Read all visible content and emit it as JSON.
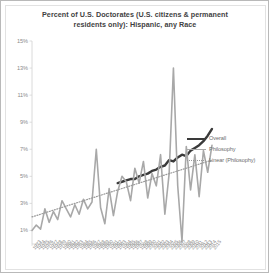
{
  "chart_data": {
    "type": "line",
    "title": "Percent of U.S. Doctorates (U.S. citizens & permanent residents only): Hispanic, any Race",
    "title_line1": "Percent of U.S. Doctorates (U.S. citizens & permanent",
    "title_line2": "residents only): Hispanic, any Race",
    "xlabel": "",
    "ylabel": "",
    "ylim": [
      0,
      15
    ],
    "yticks": [
      1,
      3,
      5,
      7,
      9,
      11,
      13,
      15
    ],
    "ytick_labels": [
      "1%",
      "3%",
      "5%",
      "7%",
      "9%",
      "11%",
      "13%",
      "15%"
    ],
    "grid": false,
    "legend_position": "right",
    "x": [
      1973,
      1974,
      1975,
      1976,
      1977,
      1978,
      1979,
      1980,
      1981,
      1982,
      1983,
      1984,
      1985,
      1986,
      1987,
      1988,
      1989,
      1990,
      1991,
      1992,
      1993,
      1994,
      1995,
      1996,
      1997,
      1998,
      1999,
      2000,
      2001,
      2002,
      2003,
      2004,
      2005,
      2006,
      2007,
      2008,
      2009,
      2010,
      2011,
      2012,
      2013,
      2014,
      2015
    ],
    "xtick_labels": [
      "1973",
      "1974",
      "1975",
      "1976",
      "1977",
      "1978",
      "1979",
      "1980",
      "1981",
      "1982",
      "1983",
      "1984",
      "1985",
      "1986",
      "1987",
      "1988",
      "1989",
      "1990",
      "1991",
      "1992",
      "1993",
      "1994",
      "1995",
      "1996",
      "1997",
      "1998",
      "1999",
      "2000",
      "2001",
      "2002",
      "2003",
      "2004",
      "2005",
      "2006",
      "2007",
      "2008",
      "2009",
      "2010",
      "2011",
      "2012",
      "2013",
      "2014",
      "2015"
    ],
    "series": [
      {
        "name": "Overall",
        "color": "#3a3a3a",
        "style": "solid",
        "width": 2.4,
        "values": [
          null,
          null,
          null,
          null,
          null,
          null,
          null,
          null,
          null,
          null,
          null,
          null,
          null,
          null,
          null,
          null,
          null,
          null,
          null,
          null,
          4.5,
          4.6,
          4.7,
          4.8,
          4.8,
          5.0,
          5.1,
          5.2,
          5.4,
          5.5,
          5.7,
          5.8,
          6.2,
          6.1,
          6.4,
          6.6,
          6.5,
          6.9,
          7.1,
          7.3,
          7.6,
          8.0,
          8.5
        ]
      },
      {
        "name": "Philosophy",
        "color": "#a8a8a8",
        "style": "solid",
        "width": 1.6,
        "values": [
          1.0,
          1.4,
          1.1,
          2.6,
          1.6,
          2.4,
          1.8,
          3.2,
          2.6,
          2.0,
          2.9,
          2.2,
          3.3,
          2.6,
          3.1,
          7.0,
          2.7,
          1.5,
          4.1,
          2.1,
          3.9,
          5.0,
          4.6,
          3.2,
          5.6,
          4.5,
          6.1,
          3.4,
          5.2,
          4.3,
          6.6,
          2.2,
          5.2,
          13.0,
          4.3,
          0.2,
          7.2,
          4.0,
          6.6,
          3.5,
          6.9,
          5.3,
          7.3
        ]
      },
      {
        "name": "Linear (Philosophy)",
        "color": "#9a9a9a",
        "style": "dotted",
        "width": 1.2,
        "values": [
          2.0,
          2.1,
          2.2,
          2.3,
          2.4,
          2.5,
          2.6,
          2.7,
          2.8,
          2.9,
          3.0,
          3.1,
          3.2,
          3.3,
          3.4,
          3.5,
          3.6,
          3.7,
          3.8,
          3.9,
          4.0,
          4.1,
          4.2,
          4.3,
          4.4,
          4.5,
          4.6,
          4.7,
          4.8,
          4.9,
          5.0,
          5.1,
          5.2,
          5.3,
          5.4,
          5.5,
          5.6,
          5.7,
          5.8,
          5.9,
          6.0,
          6.1,
          6.2
        ]
      }
    ]
  },
  "legend": {
    "items": [
      {
        "label": "Overall"
      },
      {
        "label": "Philosophy"
      },
      {
        "label": "Linear (Philosophy)"
      }
    ]
  }
}
